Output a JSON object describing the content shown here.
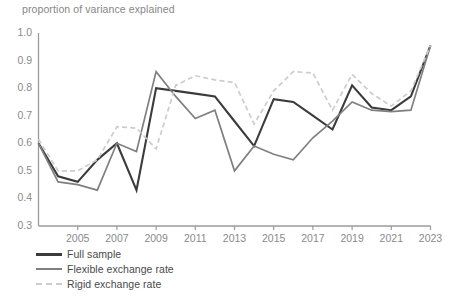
{
  "chart": {
    "title": "proportion of variance explained",
    "axis_color": "#9b9b9b",
    "tick_label_color": "#8a8a8a",
    "title_color": "#868686",
    "background": "#ffffff"
  },
  "chart_data": {
    "type": "line",
    "title": "proportion of variance explained",
    "xlabel": "",
    "ylabel": "proportion of variance explained",
    "xlim": [
      2003,
      2023
    ],
    "ylim": [
      0.3,
      1.0
    ],
    "yticks": [
      0.3,
      0.4,
      0.5,
      0.6,
      0.7,
      0.8,
      0.9,
      1.0
    ],
    "ytick_labels": [
      "0.3",
      "0.4",
      "0.5",
      "0.6",
      "0.7",
      "0.8",
      "0.9",
      "1.0"
    ],
    "xticks": [
      2005,
      2007,
      2009,
      2011,
      2013,
      2015,
      2017,
      2019,
      2021,
      2023
    ],
    "xtick_labels": [
      "2005",
      "2007",
      "2009",
      "2011",
      "2013",
      "2015",
      "2017",
      "2019",
      "2021",
      "2023"
    ],
    "grid": false,
    "legend_position": "below-axes",
    "x": [
      2003,
      2004,
      2005,
      2006,
      2007,
      2008,
      2009,
      2010,
      2011,
      2012,
      2013,
      2014,
      2015,
      2016,
      2017,
      2018,
      2019,
      2020,
      2021,
      2022,
      2023
    ],
    "series": [
      {
        "name": "Full sample",
        "label": "Full sample",
        "color": "#3b3b3b",
        "style": "solid",
        "width": 2.1,
        "values": [
          0.6,
          0.48,
          0.46,
          0.54,
          0.6,
          0.43,
          0.8,
          0.79,
          0.78,
          0.77,
          0.68,
          0.59,
          0.76,
          0.75,
          0.7,
          0.65,
          0.81,
          0.73,
          0.72,
          0.77,
          0.955
        ]
      },
      {
        "name": "Flexible exchange rate",
        "label": "Flexible exchange rate",
        "color": "#808080",
        "style": "solid",
        "width": 1.7,
        "values": [
          0.6,
          0.46,
          0.45,
          0.43,
          0.6,
          0.57,
          0.86,
          0.77,
          0.69,
          0.72,
          0.5,
          0.59,
          0.56,
          0.54,
          0.62,
          0.68,
          0.75,
          0.72,
          0.715,
          0.72,
          0.955
        ]
      },
      {
        "name": "Rigid exchange rate",
        "label": "Rigid exchange rate",
        "color": "#cccccc",
        "style": "dashed",
        "width": 1.7,
        "values": [
          0.615,
          0.5,
          0.5,
          0.54,
          0.66,
          0.655,
          0.58,
          0.81,
          0.845,
          0.83,
          0.82,
          0.67,
          0.79,
          0.86,
          0.855,
          0.72,
          0.85,
          0.78,
          0.735,
          0.79,
          0.955
        ]
      }
    ]
  },
  "legend": {
    "items": [
      {
        "label": "Full sample"
      },
      {
        "label": "Flexible exchange rate"
      },
      {
        "label": "Rigid exchange rate"
      }
    ]
  }
}
